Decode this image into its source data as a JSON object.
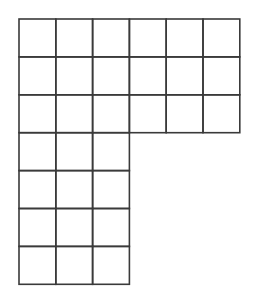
{
  "diagram": {
    "type": "grid",
    "shape": "L-shape",
    "line_color": "#3a3a3a",
    "background": "#ffffff",
    "origin": {
      "x": 19,
      "y": 19
    },
    "cell_width": 36.8,
    "cell_height": 37.9,
    "sections": [
      {
        "name": "top-block",
        "row_start": 0,
        "rows": 3,
        "col_start": 0,
        "cols": 6
      },
      {
        "name": "bottom-block",
        "row_start": 3,
        "rows": 4,
        "col_start": 0,
        "cols": 3
      }
    ],
    "total_cells": 30
  }
}
